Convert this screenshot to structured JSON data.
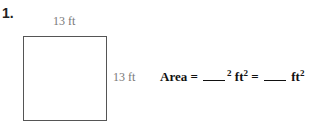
{
  "problem": {
    "number": "1.",
    "top_label": "13 ft",
    "side_label": "13 ft",
    "area_label": "Area =",
    "exponent": "2",
    "unit": "ft",
    "unit_exponent": "2",
    "equals": "=",
    "unit2": "ft",
    "unit2_exponent": "2"
  }
}
